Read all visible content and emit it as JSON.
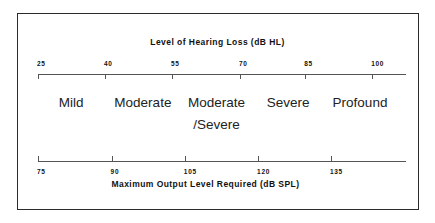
{
  "figure": {
    "name": "hearing-loss-to-output-level-scale",
    "border_color": "#2b2b2b",
    "axis_color": "#555555",
    "text_color": "#111111"
  },
  "top_axis": {
    "title": "Level of Hearing Loss (dB HL)",
    "unit": "dB HL",
    "ticks": [
      {
        "label": "25",
        "value": 25,
        "pos_pct": 0
      },
      {
        "label": "40",
        "value": 40,
        "pos_pct": 18.2
      },
      {
        "label": "55",
        "value": 55,
        "pos_pct": 36.4
      },
      {
        "label": "70",
        "value": 70,
        "pos_pct": 54.9
      },
      {
        "label": "85",
        "value": 85,
        "pos_pct": 72.6
      },
      {
        "label": "100",
        "value": 100,
        "pos_pct": 90.8
      }
    ]
  },
  "bottom_axis": {
    "title": "Maximum Output Level Required (dB SPL)",
    "unit": "dB SPL",
    "ticks": [
      {
        "label": "75",
        "value": 75,
        "pos_pct": 0
      },
      {
        "label": "90",
        "value": 90,
        "pos_pct": 20.0
      },
      {
        "label": "105",
        "value": 105,
        "pos_pct": 39.9
      },
      {
        "label": "120",
        "value": 120,
        "pos_pct": 59.8
      },
      {
        "label": "135",
        "value": 135,
        "pos_pct": 79.6
      }
    ]
  },
  "categories": [
    {
      "label": "Mild",
      "line2": "",
      "center_pct": 9.0
    },
    {
      "label": "Moderate",
      "line2": "",
      "center_pct": 28.5
    },
    {
      "label": "Moderate",
      "line2": "/Severe",
      "center_pct": 48.5
    },
    {
      "label": "Severe",
      "line2": "",
      "center_pct": 68.0
    },
    {
      "label": "Profound",
      "line2": "",
      "center_pct": 87.5
    }
  ],
  "chart_data": {
    "type": "table",
    "xlabel": "Level of Hearing Loss (dB HL)",
    "ylabel": "",
    "grid": false,
    "legend": "none",
    "axes": [
      {
        "name": "Level of Hearing Loss (dB HL)",
        "position": "top",
        "tick_labels": [
          "25",
          "40",
          "55",
          "70",
          "85",
          "100"
        ],
        "tick_values": [
          25,
          40,
          55,
          70,
          85,
          100
        ],
        "range": [
          25,
          110
        ]
      },
      {
        "name": "Maximum Output Level Required (dB SPL)",
        "position": "bottom",
        "tick_labels": [
          "75",
          "90",
          "105",
          "120",
          "135"
        ],
        "tick_values": [
          75,
          90,
          105,
          120,
          135
        ],
        "range": [
          75,
          135
        ]
      }
    ],
    "categories": [
      "Mild",
      "Moderate",
      "Moderate/Severe",
      "Severe",
      "Profound"
    ],
    "rows": [
      {
        "category": "Mild",
        "hearing_loss_db_hl": "25-40",
        "output_db_spl": "75-90"
      },
      {
        "category": "Moderate",
        "hearing_loss_db_hl": "40-55",
        "output_db_spl": "90-105"
      },
      {
        "category": "Moderate/Severe",
        "hearing_loss_db_hl": "55-70",
        "output_db_spl": "105-120"
      },
      {
        "category": "Severe",
        "hearing_loss_db_hl": "70-85",
        "output_db_spl": "120-135"
      },
      {
        "category": "Profound",
        "hearing_loss_db_hl": "85-100",
        "output_db_spl": "135+"
      }
    ]
  }
}
